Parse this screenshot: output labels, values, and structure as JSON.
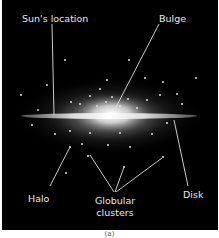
{
  "diagram": {
    "background": "#000000",
    "labels": {
      "sun_location": "Sun's location",
      "bulge": "Bulge",
      "halo": "Halo",
      "globular_clusters_line1": "Globular",
      "globular_clusters_line2": "clusters",
      "disk": "Disk"
    },
    "caption": "(a)"
  }
}
